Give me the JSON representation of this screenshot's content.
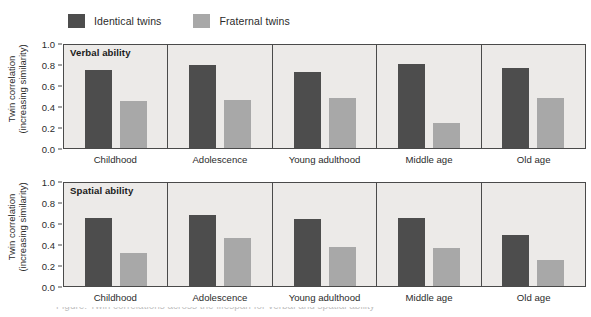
{
  "legend": {
    "entries": [
      {
        "label": "Identical twins",
        "color": "#4d4d4d",
        "icon": "legend-swatch-icon"
      },
      {
        "label": "Fraternal twins",
        "color": "#a8a8a8",
        "icon": "legend-swatch-icon"
      }
    ]
  },
  "axis": {
    "title_line1": "Twin correlation",
    "title_line2": "(increasing similarity)",
    "ticks": [
      "1.0",
      "0.8",
      "0.6",
      "0.4",
      "0.2",
      "0.0"
    ]
  },
  "caption": {
    "clipped_line": "Figure: Twin correlations across the lifespan for verbal and spatial ability"
  },
  "chart_data": {
    "type": "bar",
    "title": "",
    "xlabel": "",
    "ylabel": "Twin correlation (increasing similarity)",
    "ylim": [
      0.0,
      1.0
    ],
    "yticks": [
      0.0,
      0.2,
      0.4,
      0.6,
      0.8,
      1.0
    ],
    "grid": false,
    "legend_position": "top-left",
    "categories": [
      "Childhood",
      "Adolescence",
      "Young adulthood",
      "Middle age",
      "Old age"
    ],
    "panels": [
      {
        "title": "Verbal ability",
        "series": [
          {
            "name": "Identical twins",
            "color": "#4d4d4d",
            "values": [
              0.74,
              0.79,
              0.72,
              0.8,
              0.76
            ]
          },
          {
            "name": "Fraternal twins",
            "color": "#a8a8a8",
            "values": [
              0.45,
              0.46,
              0.48,
              0.235,
              0.48
            ]
          }
        ]
      },
      {
        "title": "Spatial ability",
        "series": [
          {
            "name": "Identical twins",
            "color": "#4d4d4d",
            "values": [
              0.65,
              0.68,
              0.64,
              0.65,
              0.49
            ]
          },
          {
            "name": "Fraternal twins",
            "color": "#a8a8a8",
            "values": [
              0.31,
              0.46,
              0.37,
              0.36,
              0.25
            ]
          }
        ]
      }
    ]
  }
}
